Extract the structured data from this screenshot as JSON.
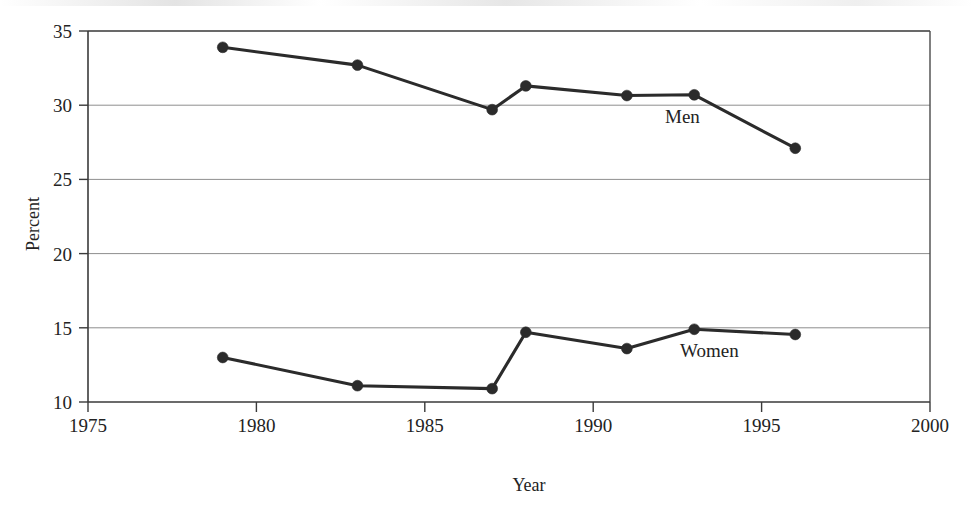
{
  "chart_data": {
    "type": "line",
    "title": "",
    "xlabel": "Year",
    "ylabel": "Percent",
    "xlim": [
      1975,
      2000
    ],
    "ylim": [
      10,
      35
    ],
    "xticks": [
      1975,
      1980,
      1985,
      1990,
      1995,
      2000
    ],
    "yticks": [
      10,
      15,
      20,
      25,
      30,
      35
    ],
    "xtick_labels": [
      "1975",
      "1980",
      "1985",
      "1990",
      "1995",
      "2000"
    ],
    "ytick_labels": [
      "10",
      "15",
      "20",
      "25",
      "30",
      "35"
    ],
    "grid": "horizontal",
    "legend_position": "inline-annotations",
    "marker": "filled-circle",
    "series": [
      {
        "name": "Men",
        "label": "Men",
        "color": "#2b2b2b",
        "x": [
          1979,
          1983,
          1987,
          1988,
          1991,
          1993,
          1996
        ],
        "values": [
          33.9,
          32.7,
          29.7,
          31.3,
          30.65,
          30.7,
          27.1
        ],
        "label_x": 1992.65,
        "label_y": 28.8
      },
      {
        "name": "Women",
        "label": "Women",
        "color": "#2b2b2b",
        "x": [
          1979,
          1983,
          1987,
          1988,
          1991,
          1993,
          1996
        ],
        "values": [
          13.0,
          11.1,
          10.9,
          14.7,
          13.6,
          14.9,
          14.55
        ],
        "label_x": 1993.45,
        "label_y": 13.0
      }
    ]
  },
  "axes": {
    "y_axis_title": "Percent",
    "x_axis_title": "Year"
  }
}
